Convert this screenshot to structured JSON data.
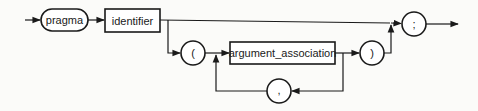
{
  "diagram": {
    "nodes": {
      "pragma": {
        "label": "pragma",
        "kind": "keyword"
      },
      "identifier": {
        "label": "identifier",
        "kind": "nonterminal"
      },
      "lparen": {
        "label": "(",
        "kind": "symbol"
      },
      "argument_association": {
        "label": "argument_association",
        "kind": "nonterminal"
      },
      "comma": {
        "label": ",",
        "kind": "symbol"
      },
      "rparen": {
        "label": ")",
        "kind": "symbol"
      },
      "semicolon": {
        "label": ";",
        "kind": "symbol"
      }
    },
    "colors": {
      "stroke": "#1a1a1a",
      "background": "#fbfbf9",
      "node_fill": "#ffffff"
    }
  }
}
